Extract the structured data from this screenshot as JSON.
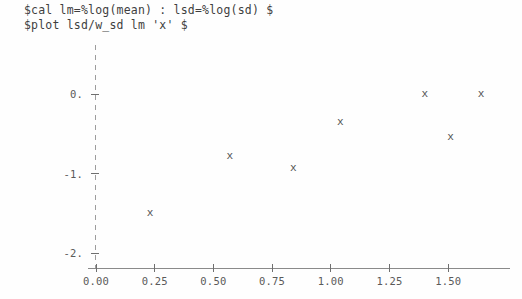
{
  "console": {
    "lines": [
      "$cal lm=%log(mean) : lsd=%log(sd) $",
      "$plot lsd/w_sd lm 'x' $"
    ]
  },
  "marker_glyph": "x",
  "colors": {
    "background": "#fefefe",
    "text": "#3f3f3f",
    "axis": "#8a8a8a",
    "dashed_axis": "#9d9d9d",
    "tick_label": "#5a5a5a",
    "marker": "#555555"
  },
  "chart_data": {
    "type": "scatter",
    "title": "",
    "xlabel": "",
    "ylabel": "",
    "xlim": [
      -0.05,
      1.78
    ],
    "ylim": [
      -2.18,
      0.25
    ],
    "xticks": [
      0.0,
      0.25,
      0.5,
      0.75,
      1.0,
      1.25,
      1.5
    ],
    "xtick_labels": [
      "0.00",
      "0.25",
      "0.50",
      "0.75",
      "1.00",
      "1.25",
      "1.50"
    ],
    "yticks": [
      0,
      -1,
      -2
    ],
    "ytick_labels": [
      "0.",
      "-1.",
      "-2."
    ],
    "grid": false,
    "legend": null,
    "marker": "x",
    "series": [
      {
        "name": "lsd vs lm",
        "points": [
          {
            "x": 0.23,
            "y": -1.49
          },
          {
            "x": 0.57,
            "y": -0.77
          },
          {
            "x": 0.84,
            "y": -0.93
          },
          {
            "x": 1.04,
            "y": -0.35
          },
          {
            "x": 1.4,
            "y": 0.01
          },
          {
            "x": 1.51,
            "y": -0.53
          },
          {
            "x": 1.64,
            "y": 0.01
          }
        ]
      }
    ]
  }
}
